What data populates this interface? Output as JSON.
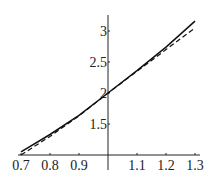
{
  "chart_data": {
    "type": "line",
    "title": "",
    "xlabel": "",
    "ylabel": "",
    "xlim": [
      0.7,
      1.3
    ],
    "ylim": [
      1.0,
      3.2
    ],
    "grid": false,
    "legend": null,
    "x_ticks": [
      "0.7",
      "0.8",
      "0.9",
      "1.1",
      "1.2",
      "1.3"
    ],
    "y_ticks": [
      "1.5",
      "2",
      "2.5",
      "3"
    ],
    "x": [
      0.7,
      0.8,
      0.9,
      1.0,
      1.1,
      1.2,
      1.3
    ],
    "series": [
      {
        "name": "solid",
        "style": "solid",
        "values": [
          1.05,
          1.33,
          1.64,
          2.0,
          2.36,
          2.74,
          3.16
        ]
      },
      {
        "name": "dashed",
        "style": "dashed",
        "values": [
          1.0,
          1.3,
          1.63,
          2.0,
          2.35,
          2.7,
          3.05
        ]
      }
    ]
  },
  "axes": {
    "x_tick_labels": [
      "0.7",
      "0.8",
      "0.9",
      "1.1",
      "1.2",
      "1.3"
    ],
    "y_tick_labels": [
      "1.5",
      "2",
      "2.5",
      "3"
    ]
  }
}
